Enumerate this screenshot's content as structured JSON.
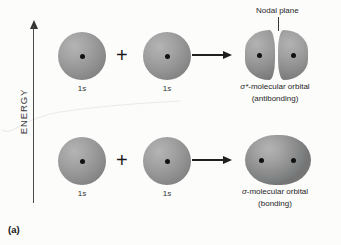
{
  "figure": {
    "caption": "(a)",
    "axis": {
      "label": "ENERGY"
    },
    "operators": {
      "plus": "+",
      "arrow": "arrow-right"
    },
    "annotations": {
      "nodal_plane": "Nodal plane"
    },
    "rows": [
      {
        "id": "antibonding",
        "reactants": [
          {
            "label_prefix": "1",
            "label_orbital": "s"
          },
          {
            "label_prefix": "1",
            "label_orbital": "s"
          }
        ],
        "product": {
          "name_sigma": "σ*",
          "name_rest": "-molecular orbital",
          "subtitle": "(antibonding)",
          "shape": "two-lobes-split"
        }
      },
      {
        "id": "bonding",
        "reactants": [
          {
            "label_prefix": "1",
            "label_orbital": "s"
          },
          {
            "label_prefix": "1",
            "label_orbital": "s"
          }
        ],
        "product": {
          "name_sigma": "σ",
          "name_rest": "-molecular orbital",
          "subtitle": "(bonding)",
          "shape": "merged-oval"
        }
      }
    ],
    "colors": {
      "orbital_fill": "#8e8e8e",
      "orbital_highlight": "#b4b4b4",
      "nucleus": "#111111",
      "arrow": "#1f1f1f",
      "axis": "#4a4a4a",
      "background": "#fcfcfb"
    }
  }
}
